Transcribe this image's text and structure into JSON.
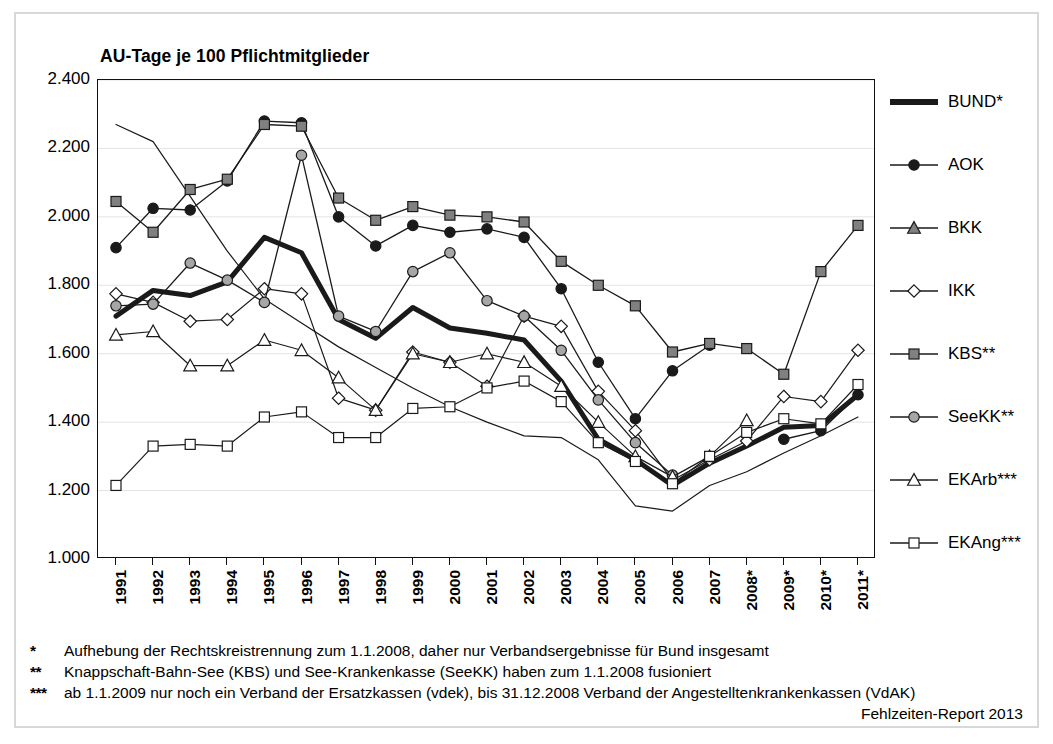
{
  "chart_title": "AU-Tage je 100 Pflichtmitglieder",
  "source_note": "Fehlzeiten-Report 2013",
  "axes": {
    "y_ticks": [
      "1.000",
      "1.200",
      "1.400",
      "1.600",
      "1.800",
      "2.000",
      "2.200",
      "2.400"
    ],
    "x_ticks": [
      "1991",
      "1992",
      "1993",
      "1994",
      "1995",
      "1996",
      "1997",
      "1998",
      "1999",
      "2000",
      "2001",
      "2002",
      "2003",
      "2004",
      "2005",
      "2006",
      "2007",
      "2008*",
      "2009*",
      "2010*",
      "2011*"
    ]
  },
  "legend": {
    "items": [
      {
        "label": "BUND*",
        "marker": "thick-line",
        "fill": "#1a1a1a"
      },
      {
        "label": "AOK",
        "marker": "circle",
        "fill": "#1a1a1a"
      },
      {
        "label": "BKK",
        "marker": "triangle",
        "fill": "#808080"
      },
      {
        "label": "IKK",
        "marker": "diamond",
        "fill": "#ffffff"
      },
      {
        "label": "KBS**",
        "marker": "square",
        "fill": "#808080"
      },
      {
        "label": "SeeKK**",
        "marker": "circle",
        "fill": "#a6a6a6"
      },
      {
        "label": "EKArb***",
        "marker": "triangle",
        "fill": "#ffffff"
      },
      {
        "label": "EKAng***",
        "marker": "square",
        "fill": "#ffffff"
      }
    ]
  },
  "footnotes": [
    {
      "mark": "*",
      "text": "Aufhebung der Rechtskreistrennung zum 1.1.2008, daher nur Verbandsergebnisse für Bund insgesamt"
    },
    {
      "mark": "**",
      "text": "Knappschaft-Bahn-See (KBS) und See-Krankenkasse (SeeKK) haben zum 1.1.2008 fusioniert"
    },
    {
      "mark": "***",
      "text": "ab 1.1.2009 nur noch ein Verband der Ersatzkassen (vdek), bis 31.12.2008 Verband der Angestelltenkrankenkassen (VdAK)"
    }
  ],
  "chart_data": {
    "type": "line",
    "title": "AU-Tage je 100 Pflichtmitglieder",
    "xlabel": "",
    "ylabel": "",
    "ylim": [
      1000,
      2400
    ],
    "ytick_values": [
      1000,
      1200,
      1400,
      1600,
      1800,
      2000,
      2200,
      2400
    ],
    "grid": true,
    "legend_position": "right",
    "categories": [
      "1991",
      "1992",
      "1993",
      "1994",
      "1995",
      "1996",
      "1997",
      "1998",
      "1999",
      "2000",
      "2001",
      "2002",
      "2003",
      "2004",
      "2005",
      "2006",
      "2007",
      "2008*",
      "2009*",
      "2010*",
      "2011*"
    ],
    "series": [
      {
        "name": "BUND*",
        "marker": "thick-line",
        "fill": "#1a1a1a",
        "linewidth": 5,
        "values": [
          1710,
          1785,
          1770,
          1810,
          1940,
          1895,
          1700,
          1645,
          1735,
          1675,
          1660,
          1640,
          1520,
          1350,
          1290,
          1215,
          1280,
          1330,
          1385,
          1390,
          1480
        ]
      },
      {
        "name": "AOK",
        "marker": "circle",
        "fill": "#1a1a1a",
        "linewidth": 1.3,
        "values": [
          1910,
          2025,
          2020,
          2105,
          2280,
          2275,
          2000,
          1915,
          1975,
          1955,
          1965,
          1940,
          1790,
          1575,
          1410,
          1550,
          1625,
          null,
          1350,
          1375,
          1480
        ]
      },
      {
        "name": "BKK",
        "marker": "none",
        "fill": "#808080",
        "linewidth": 1.2,
        "values": [
          2270,
          2220,
          2060,
          1900,
          1760,
          1690,
          1620,
          1560,
          1500,
          1445,
          1400,
          1360,
          1355,
          1290,
          1155,
          1140,
          1215,
          1255,
          1310,
          1360,
          1415
        ]
      },
      {
        "name": "IKK",
        "marker": "diamond",
        "fill": "#ffffff",
        "linewidth": 1.2,
        "values": [
          1775,
          1750,
          1695,
          1700,
          1790,
          1775,
          1470,
          1435,
          1605,
          1575,
          1505,
          1710,
          1680,
          1490,
          1375,
          1230,
          1290,
          1345,
          1475,
          1460,
          1610
        ]
      },
      {
        "name": "KBS**",
        "marker": "square",
        "fill": "#808080",
        "linewidth": 1.3,
        "values": [
          2045,
          1955,
          2080,
          2110,
          2270,
          2265,
          2055,
          1990,
          2030,
          2005,
          2000,
          1985,
          1870,
          1800,
          1740,
          1605,
          1630,
          1615,
          1540,
          1840,
          1975
        ]
      },
      {
        "name": "SeeKK**",
        "marker": "circle",
        "fill": "#a6a6a6",
        "linewidth": 1.3,
        "values": [
          1740,
          1745,
          1865,
          1815,
          1750,
          2180,
          1710,
          1665,
          1840,
          1895,
          1755,
          1710,
          1610,
          1465,
          1340,
          1245,
          null,
          null,
          null,
          null,
          null
        ]
      },
      {
        "name": "EKArb***",
        "marker": "triangle",
        "fill": "#ffffff",
        "linewidth": 1.2,
        "values": [
          1655,
          1665,
          1565,
          1565,
          1640,
          1610,
          1530,
          1435,
          1600,
          1575,
          1600,
          1575,
          1505,
          1400,
          1300,
          1240,
          1300,
          1405,
          null,
          null,
          null
        ]
      },
      {
        "name": "EKAng***",
        "marker": "square",
        "fill": "#ffffff",
        "linewidth": 1.2,
        "values": [
          1215,
          1330,
          1335,
          1330,
          1415,
          1430,
          1355,
          1355,
          1440,
          1445,
          1500,
          1520,
          1460,
          1340,
          1285,
          1220,
          1300,
          1370,
          1410,
          1395,
          1510
        ]
      }
    ]
  }
}
